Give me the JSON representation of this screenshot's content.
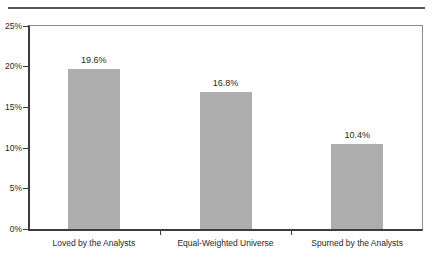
{
  "chart_data": {
    "type": "bar",
    "categories": [
      "Loved by the Analysts",
      "Equal-Weighted Universe",
      "Spurned by the Analysts"
    ],
    "values": [
      19.6,
      16.8,
      10.4
    ],
    "value_labels": [
      "19.6%",
      "16.8%",
      "10.4%"
    ],
    "title": "",
    "xlabel": "",
    "ylabel": "",
    "ylim": [
      0,
      25
    ],
    "y_tick_step": 5,
    "y_tick_labels": [
      "0%",
      "5%",
      "10%",
      "15%",
      "20%",
      "25%"
    ],
    "grid": "off",
    "legend": "none",
    "colors": {
      "bar": "#adadad",
      "axis": "#3c3c3c",
      "frame": "#8c8c8c",
      "top_rule": "#565656",
      "text": "#1f1f1f",
      "background": "#ffffff"
    }
  }
}
